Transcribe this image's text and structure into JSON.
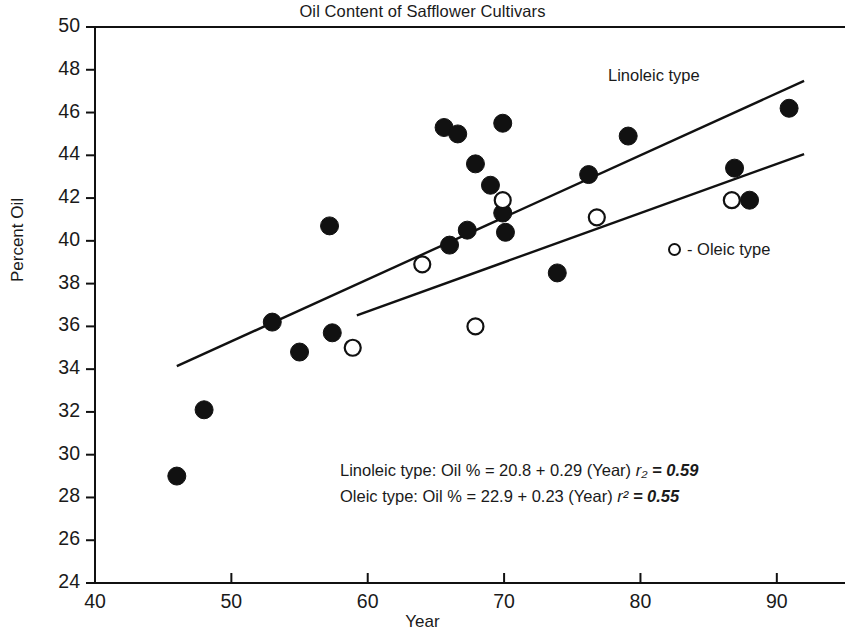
{
  "chart_data": {
    "type": "scatter",
    "title": "Oil Content of Safflower Cultivars",
    "xlabel": "Year",
    "ylabel": "Percent Oil",
    "xlim": [
      40,
      95
    ],
    "ylim": [
      24,
      50
    ],
    "xticks": [
      40,
      50,
      60,
      70,
      80,
      90
    ],
    "yticks": [
      24,
      26,
      28,
      30,
      32,
      34,
      36,
      38,
      40,
      42,
      44,
      46,
      48,
      50
    ],
    "grid": false,
    "legend_position": "inside-right",
    "series": [
      {
        "name": "Linoleic type",
        "marker": "filled-circle",
        "color": "#111111",
        "points": [
          {
            "x": 46.0,
            "y": 29.0
          },
          {
            "x": 48.0,
            "y": 32.1
          },
          {
            "x": 53.0,
            "y": 36.2
          },
          {
            "x": 55.0,
            "y": 34.8
          },
          {
            "x": 57.4,
            "y": 35.7
          },
          {
            "x": 57.2,
            "y": 40.7
          },
          {
            "x": 65.6,
            "y": 45.3
          },
          {
            "x": 66.6,
            "y": 45.0
          },
          {
            "x": 66.0,
            "y": 39.8
          },
          {
            "x": 67.9,
            "y": 43.6
          },
          {
            "x": 67.3,
            "y": 40.5
          },
          {
            "x": 69.0,
            "y": 42.6
          },
          {
            "x": 69.9,
            "y": 45.5
          },
          {
            "x": 69.9,
            "y": 41.3
          },
          {
            "x": 70.1,
            "y": 40.4
          },
          {
            "x": 73.9,
            "y": 38.5
          },
          {
            "x": 76.2,
            "y": 43.1
          },
          {
            "x": 79.1,
            "y": 44.9
          },
          {
            "x": 86.9,
            "y": 43.4
          },
          {
            "x": 88.0,
            "y": 41.9
          },
          {
            "x": 90.9,
            "y": 46.2
          }
        ]
      },
      {
        "name": "Oleic type",
        "marker": "open-circle",
        "color": "#111111",
        "points": [
          {
            "x": 58.9,
            "y": 35.0
          },
          {
            "x": 64.0,
            "y": 38.9
          },
          {
            "x": 67.9,
            "y": 36.0
          },
          {
            "x": 69.9,
            "y": 41.9
          },
          {
            "x": 76.8,
            "y": 41.1
          },
          {
            "x": 86.7,
            "y": 41.9
          }
        ]
      }
    ],
    "fit_lines": [
      {
        "name": "Linoleic type",
        "intercept": 20.8,
        "slope": 0.29,
        "r_squared": 0.59,
        "x_start": 46.0,
        "x_end": 92.0
      },
      {
        "name": "Oleic type",
        "intercept": 22.9,
        "slope": 0.23,
        "r_squared": 0.55,
        "x_start": 59.2,
        "x_end": 92.0
      }
    ],
    "annotations": {
      "linoleic_line_label": "Linoleic type",
      "legend_oleic": "- Oleic type",
      "equation_linoleic_text": "Linoleic type: Oil % = 20.8 + 0.29 (Year) ",
      "equation_linoleic_rsym": "r₂",
      "equation_linoleic_rval": " = 0.59",
      "equation_oleic_text": "Oleic type: Oil % = 22.9 + 0.23 (Year) ",
      "equation_oleic_rsym": "r²",
      "equation_oleic_rval": " = 0.55"
    }
  },
  "axes": {
    "y_tick_labels": [
      "50",
      "48",
      "46",
      "44",
      "42",
      "40",
      "38",
      "36",
      "34",
      "32",
      "30",
      "28",
      "26",
      "24"
    ],
    "x_tick_labels": [
      "40",
      "50",
      "60",
      "70",
      "80",
      "90"
    ]
  },
  "colors": {
    "ink": "#111111",
    "background": "#ffffff"
  }
}
